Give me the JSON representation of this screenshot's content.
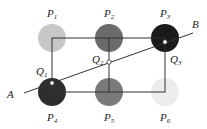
{
  "diagram": {
    "nodes": [
      {
        "id": "P1",
        "label": "P",
        "sub": "1",
        "fill": "#c8c8c8"
      },
      {
        "id": "P2",
        "label": "P",
        "sub": "2",
        "fill": "#6b6b6b"
      },
      {
        "id": "P3",
        "label": "P",
        "sub": "3",
        "fill": "#1a1a1a"
      },
      {
        "id": "P4",
        "label": "P",
        "sub": "4",
        "fill": "#2e2e2e"
      },
      {
        "id": "P5",
        "label": "P",
        "sub": "5",
        "fill": "#7a7a7a"
      },
      {
        "id": "P6",
        "label": "P",
        "sub": "6",
        "fill": "#ececec"
      }
    ],
    "points": [
      {
        "id": "Q1",
        "label": "Q",
        "sub": "1"
      },
      {
        "id": "Q2",
        "label": "Q",
        "sub": "2"
      },
      {
        "id": "Q3",
        "label": "Q",
        "sub": "3"
      }
    ],
    "line": {
      "start_label": "A",
      "end_label": "B"
    }
  }
}
